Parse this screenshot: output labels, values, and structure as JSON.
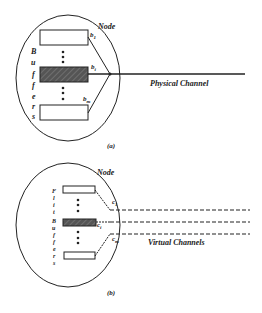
{
  "figure_a": {
    "node_label": "Node",
    "buffer_vertical_letters": [
      "B",
      "u",
      "f",
      "f",
      "e",
      "r",
      "s"
    ],
    "buffer_labels": {
      "first": "b",
      "first_sub": "1",
      "mid": "b",
      "mid_sub": "i",
      "last": "b",
      "last_sub": "m"
    },
    "channel_label": "Physical Channel",
    "caption": "(a)"
  },
  "figure_b": {
    "node_label": "Node",
    "buffer_vertical_letters": [
      "F",
      "l",
      "i",
      "t",
      "B",
      "u",
      "f",
      "f",
      "e",
      "r",
      "s"
    ],
    "channel_labels": {
      "first": "c",
      "first_sub": "1",
      "mid": "c",
      "mid_sub": "i",
      "last": "c",
      "last_sub": "m"
    },
    "channel_label": "Virtual Channels",
    "caption": "(b)"
  },
  "colors": {
    "line": "#222222",
    "shaded_buffer": "#555555",
    "background": "#ffffff"
  }
}
